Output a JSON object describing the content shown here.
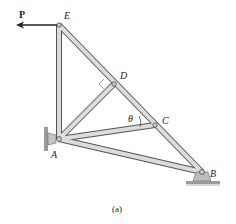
{
  "figure": {
    "caption": "(a)",
    "force": {
      "label": "P",
      "direction": "left"
    },
    "angle_label": "θ",
    "nodes": [
      {
        "id": "E",
        "label": "E",
        "x": 59,
        "y": 25
      },
      {
        "id": "D",
        "label": "D",
        "x": 114,
        "y": 84
      },
      {
        "id": "C",
        "label": "C",
        "x": 155,
        "y": 125
      },
      {
        "id": "A",
        "label": "A",
        "x": 59,
        "y": 139
      },
      {
        "id": "B",
        "label": "B",
        "x": 202,
        "y": 172
      }
    ],
    "members": [
      [
        "E",
        "A"
      ],
      [
        "E",
        "D"
      ],
      [
        "D",
        "C"
      ],
      [
        "C",
        "B"
      ],
      [
        "A",
        "D"
      ],
      [
        "A",
        "C"
      ],
      [
        "A",
        "B"
      ]
    ],
    "supports": [
      {
        "node": "A",
        "type": "pin-wall"
      },
      {
        "node": "B",
        "type": "pin-ground"
      }
    ],
    "right_angle_marker": {
      "at": "D"
    }
  }
}
